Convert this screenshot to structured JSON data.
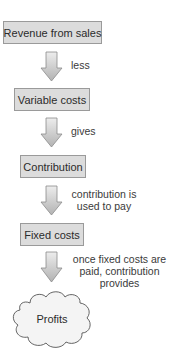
{
  "diagram": {
    "type": "flowchart",
    "nodes": [
      {
        "id": "revenue",
        "label": "Revenue from sales",
        "shape": "box"
      },
      {
        "id": "variable_costs",
        "label": "Variable costs",
        "shape": "box"
      },
      {
        "id": "contribution",
        "label": "Contribution",
        "shape": "box"
      },
      {
        "id": "fixed_costs",
        "label": "Fixed costs",
        "shape": "box"
      },
      {
        "id": "profits",
        "label": "Profits",
        "shape": "cloud"
      }
    ],
    "edges": [
      {
        "from": "revenue",
        "to": "variable_costs",
        "label": "less"
      },
      {
        "from": "variable_costs",
        "to": "contribution",
        "label": "gives"
      },
      {
        "from": "contribution",
        "to": "fixed_costs",
        "label_lines": [
          "contribution is",
          "used to pay"
        ]
      },
      {
        "from": "fixed_costs",
        "to": "profits",
        "label_lines": [
          "once fixed costs are",
          "paid, contribution",
          "provides"
        ]
      }
    ],
    "colors": {
      "box_fill": "#dcdcdc",
      "box_border": "#9a9a9a",
      "arrow_top": "#ececec",
      "arrow_bottom": "#b4b4b4",
      "cloud_fill": "#f2f2f2",
      "cloud_stroke": "#555555"
    }
  }
}
